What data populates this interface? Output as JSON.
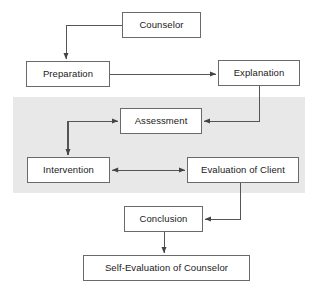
{
  "diagram": {
    "type": "flowchart",
    "canvas": {
      "width": 318,
      "height": 289,
      "background": "#ffffff"
    },
    "shaded_region": {
      "label": "session-phase-shaded-band",
      "color": "#e8e8e8",
      "x": 13,
      "y": 97,
      "width": 292,
      "height": 96
    },
    "style": {
      "box_border_color": "#6a6a6a",
      "box_fill": "#ffffff",
      "connector_color": "#555555",
      "text_color": "#1a1a1a"
    },
    "nodes": [
      {
        "id": "counselor",
        "label": "Counselor",
        "x": 122,
        "y": 12,
        "width": 79,
        "height": 26
      },
      {
        "id": "preparation",
        "label": "Preparation",
        "x": 26,
        "y": 61,
        "width": 84,
        "height": 26
      },
      {
        "id": "explanation",
        "label": "Explanation",
        "x": 218,
        "y": 60,
        "width": 82,
        "height": 26
      },
      {
        "id": "assessment",
        "label": "Assessment",
        "x": 120,
        "y": 108,
        "width": 82,
        "height": 26
      },
      {
        "id": "intervention",
        "label": "Intervention",
        "x": 27,
        "y": 157,
        "width": 83,
        "height": 26
      },
      {
        "id": "evaluation",
        "label": "Evaluation of Client",
        "x": 187,
        "y": 157,
        "width": 112,
        "height": 26
      },
      {
        "id": "conclusion",
        "label": "Conclusion",
        "x": 124,
        "y": 206,
        "width": 79,
        "height": 26
      },
      {
        "id": "self_evaluation",
        "label": "Self-Evaluation of Counselor",
        "x": 83,
        "y": 255,
        "width": 167,
        "height": 26
      }
    ],
    "connectors": [
      {
        "id": "counselor-to-preparation",
        "from": "counselor",
        "to": "preparation",
        "arrows": "end",
        "path": "M 122 25 L 66 25 L 66 59"
      },
      {
        "id": "preparation-to-explanation",
        "from": "preparation",
        "to": "explanation",
        "arrows": "end",
        "path": "M 110 74 L 216 74"
      },
      {
        "id": "explanation-to-assessment",
        "from": "explanation",
        "to": "assessment",
        "arrows": "end",
        "path": "M 259 86 L 259 121 L 204 121"
      },
      {
        "id": "intervention-loop-to-assessment",
        "from": "intervention",
        "to": "assessment",
        "arrows": "end",
        "path": "M 67 155 L 67 121 L 118 121"
      },
      {
        "id": "assessment-down-to-intervention",
        "from": "assessment",
        "to": "intervention",
        "arrows": "end",
        "path": "M 68 121 L 68 155"
      },
      {
        "id": "intervention-evaluation-link",
        "from": "intervention",
        "to": "evaluation",
        "arrows": "both",
        "path": "M 112 170 L 185 170"
      },
      {
        "id": "evaluation-to-conclusion",
        "from": "evaluation",
        "to": "conclusion",
        "arrows": "end",
        "path": "M 240 183 L 240 219 L 205 219"
      },
      {
        "id": "conclusion-to-self-evaluation",
        "from": "conclusion",
        "to": "self_evaluation",
        "arrows": "end",
        "path": "M 164 232 L 164 253"
      }
    ]
  }
}
